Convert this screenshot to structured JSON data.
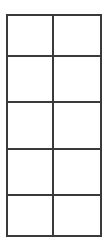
{
  "grid": {
    "rows": 5,
    "columns": 2,
    "line_color": "#3a3a3a",
    "background": "#ffffff",
    "cells": [
      [
        "",
        ""
      ],
      [
        "",
        ""
      ],
      [
        "",
        ""
      ],
      [
        "",
        ""
      ],
      [
        "",
        ""
      ]
    ]
  }
}
